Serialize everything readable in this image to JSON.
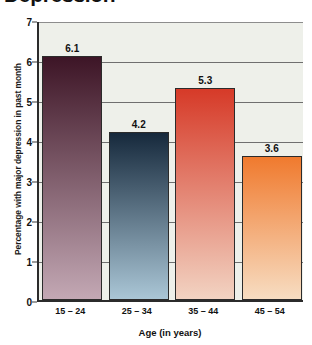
{
  "chart_data": {
    "type": "bar",
    "title": "Depression",
    "title_truncated": true,
    "categories": [
      "15 – 24",
      "25 – 34",
      "35 – 44",
      "45 – 54"
    ],
    "values": [
      6.1,
      4.2,
      5.3,
      3.6
    ],
    "value_labels": [
      "6.1",
      "4.2",
      "5.3",
      "3.6"
    ],
    "xlabel": "Age (in years)",
    "ylabel": "Percentage with major depression in past month",
    "ylim": [
      0,
      7
    ],
    "yticks": [
      0,
      1,
      2,
      3,
      4,
      5,
      6,
      7
    ],
    "ytick_labels": [
      "0",
      "1",
      "2",
      "3",
      "4",
      "5",
      "6",
      "7"
    ],
    "grid": true,
    "grid_axis": "y",
    "legend": null,
    "bar_colors": [
      {
        "top": "#3d1526",
        "bottom": "#c3a8b4"
      },
      {
        "top": "#16293c",
        "bottom": "#aac6d6"
      },
      {
        "top": "#d63a28",
        "bottom": "#f2d3c2"
      },
      {
        "top": "#f07a2e",
        "bottom": "#f7ddc2"
      }
    ],
    "plot_background": "#eef0ea",
    "axis_color": "#2b2b2b",
    "gridline_color": "#6f6f6f"
  }
}
